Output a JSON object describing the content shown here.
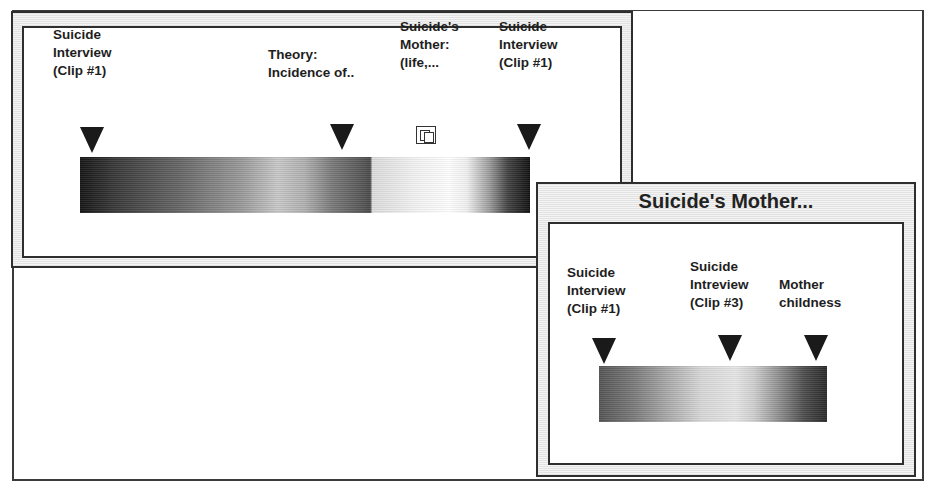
{
  "main_window": {
    "markers": [
      {
        "lines": [
          "Suicide",
          "Interview",
          "(Clip #1)"
        ]
      },
      {
        "lines": [
          "Theory:",
          "Incidence of.."
        ]
      },
      {
        "lines": [
          "Suicide's",
          "Mother:",
          "(life,..."
        ],
        "icon": "stacked-windows-icon"
      },
      {
        "lines": [
          "Suicide",
          "Interview",
          "(Clip #1)"
        ]
      }
    ]
  },
  "popup_window": {
    "title": "Suicide's Mother...",
    "markers": [
      {
        "lines": [
          "Suicide",
          "Interview",
          "(Clip #1)"
        ]
      },
      {
        "lines": [
          "Suicide",
          "Intreview",
          "(Clip #3)"
        ]
      },
      {
        "lines": [
          "Mother",
          "childness"
        ]
      }
    ]
  },
  "colors": {
    "frame": "#2e2e2e",
    "marker": "#1a1a1a",
    "background": "#ffffff"
  }
}
